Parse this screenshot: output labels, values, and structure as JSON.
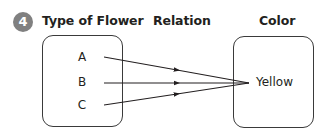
{
  "problem": {
    "number": "4"
  },
  "headers": {
    "domain": "Type of Flower",
    "relation": "Relation",
    "range": "Color"
  },
  "domain_items": [
    "A",
    "B",
    "C"
  ],
  "range_items": [
    "Yellow"
  ],
  "mappings": [
    {
      "from": "A",
      "to": "Yellow"
    },
    {
      "from": "B",
      "to": "Yellow"
    },
    {
      "from": "C",
      "to": "Yellow"
    }
  ],
  "colors": {
    "badge": "#808080",
    "lines": "#231f20"
  }
}
